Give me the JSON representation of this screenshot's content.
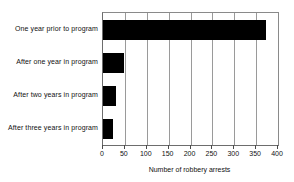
{
  "chart_data": {
    "type": "bar",
    "orientation": "horizontal",
    "title": "",
    "xlabel": "Number of robbery arrests",
    "ylabel": "",
    "categories": [
      "One year prior to program",
      "After one year in program",
      "After two years in program",
      "After three years in program"
    ],
    "values": [
      372,
      47,
      30,
      22
    ],
    "xlim": [
      0,
      400
    ],
    "xticks": [
      0,
      50,
      100,
      150,
      200,
      250,
      300,
      350,
      400
    ],
    "xtick_labels": [
      "0",
      "50",
      "100",
      "150",
      "200",
      "250",
      "300",
      "350",
      "400"
    ],
    "grid": true,
    "grid_axis": "x",
    "legend": null,
    "bar_color": "#000000",
    "plot_background": "#ffffff",
    "axis_color": "#6d6d6d"
  }
}
